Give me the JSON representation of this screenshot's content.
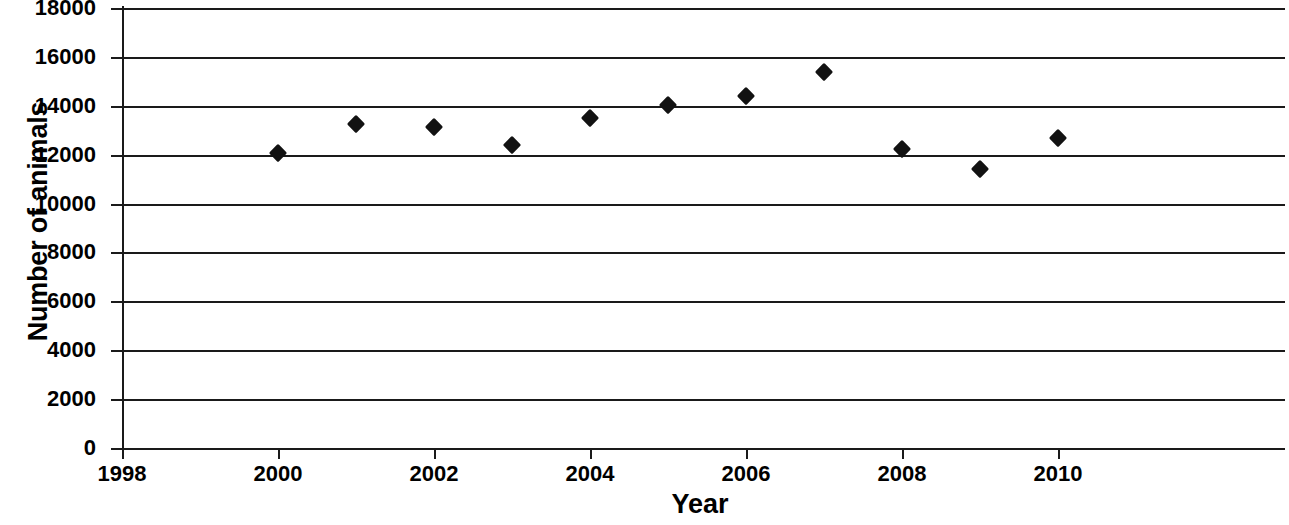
{
  "chart_data": {
    "type": "scatter",
    "title": "",
    "xlabel": "Year",
    "ylabel": "Number of animals",
    "xlim": [
      1998,
      2011
    ],
    "ylim": [
      0,
      18000
    ],
    "x_ticks": [
      1998,
      2000,
      2002,
      2004,
      2006,
      2008,
      2010
    ],
    "x_tick_labels": [
      "1998",
      "2000",
      "2002",
      "2004",
      "2006",
      "2008",
      "2010"
    ],
    "y_ticks": [
      0,
      2000,
      4000,
      6000,
      8000,
      10000,
      12000,
      14000,
      16000,
      18000
    ],
    "y_tick_labels": [
      "0",
      "2000",
      "4000",
      "6000",
      "8000",
      "10000",
      "12000",
      "14000",
      "16000",
      "18000"
    ],
    "grid": "horizontal",
    "legend": "none",
    "marker": "diamond",
    "marker_color": "#121212",
    "x": [
      2000,
      2001,
      2002,
      2003,
      2004,
      2005,
      2006,
      2007,
      2008,
      2009,
      2010
    ],
    "values": [
      12050,
      13250,
      13150,
      12400,
      13500,
      14050,
      14380,
      15400,
      12250,
      11400,
      12700
    ],
    "points": [
      {
        "year": 2000,
        "value": 12050
      },
      {
        "year": 2001,
        "value": 13250
      },
      {
        "year": 2002,
        "value": 13150
      },
      {
        "year": 2003,
        "value": 12400
      },
      {
        "year": 2004,
        "value": 13500
      },
      {
        "year": 2005,
        "value": 14050
      },
      {
        "year": 2006,
        "value": 14380
      },
      {
        "year": 2007,
        "value": 15400
      },
      {
        "year": 2008,
        "value": 12250
      },
      {
        "year": 2009,
        "value": 11400
      },
      {
        "year": 2010,
        "value": 12700
      }
    ]
  },
  "axis_color": "#1a1a1a",
  "background_color": "#ffffff"
}
